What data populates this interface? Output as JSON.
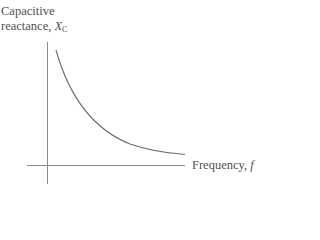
{
  "diagram": {
    "title": "",
    "y_axis": {
      "label_line1": "Capacitive",
      "label_line2": "reactance, ",
      "symbol": "X",
      "subscript": "C"
    },
    "x_axis": {
      "label": "Frequency, ",
      "symbol": "f"
    },
    "curve": {
      "description": "Inverse relationship: capacitive reactance decreases as frequency increases (X_C = 1/(2πfC))",
      "shape": "hyperbolic decay"
    },
    "colors": {
      "axis": "#8a8a8a",
      "curve": "#6a6a6a",
      "text": "#505050"
    }
  }
}
